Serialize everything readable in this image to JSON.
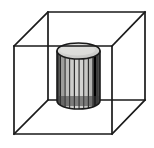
{
  "canvas": {
    "width": 154,
    "height": 148,
    "background": "#ffffff",
    "title": "Wireframe cube containing a fluted cylinder"
  },
  "colors": {
    "stroke": "#1a1a1a",
    "cylinder_outline": "#1a1a1a",
    "cylinder_top_fill": "#d8d8d6",
    "cylinder_body_light": "#c9c9c7",
    "cylinder_body_mid": "#9a9a98",
    "cylinder_body_dark": "#4a4a4a",
    "cylinder_edge_dark": "#2b2b2b",
    "background": "#ffffff"
  },
  "cube": {
    "label": "wireframe cube",
    "stroke_width": 1.7,
    "projection": "oblique",
    "front_face": {
      "label": "front face",
      "top_left": [
        14,
        46
      ],
      "top_right": [
        112,
        46
      ],
      "bottom_right": [
        112,
        134
      ],
      "bottom_left": [
        14,
        134
      ]
    },
    "back_face": {
      "label": "back face",
      "top_left": [
        48,
        12
      ],
      "top_right": [
        145,
        12
      ],
      "bottom_right": [
        145,
        100
      ],
      "bottom_left": [
        48,
        100
      ]
    },
    "connecting_edges": [
      {
        "name": "edge-top-left",
        "from": [
          14,
          46
        ],
        "to": [
          48,
          12
        ]
      },
      {
        "name": "edge-top-right",
        "from": [
          112,
          46
        ],
        "to": [
          145,
          12
        ]
      },
      {
        "name": "edge-bottom-right",
        "from": [
          112,
          134
        ],
        "to": [
          145,
          100
        ]
      },
      {
        "name": "edge-bottom-left",
        "from": [
          14,
          134
        ],
        "to": [
          48,
          100
        ]
      }
    ]
  },
  "cylinder": {
    "label": "fluted cylinder",
    "center_x": 78.5,
    "left_x": 57,
    "right_x": 100,
    "radius_x": 21.5,
    "top_y": 51,
    "bottom_y": 101,
    "ellipse_radius_y": 8,
    "stroke_width": 1.6,
    "flute_count": 10,
    "flutes": [
      {
        "index": 0,
        "x": 58.5,
        "width": 3.6,
        "shade": "#6a6a68"
      },
      {
        "index": 1,
        "x": 62.6,
        "width": 3.6,
        "shade": "#b0b0ae"
      },
      {
        "index": 2,
        "x": 66.7,
        "width": 3.6,
        "shade": "#c9c9c7"
      },
      {
        "index": 3,
        "x": 70.8,
        "width": 3.6,
        "shade": "#d2d2d0"
      },
      {
        "index": 4,
        "x": 74.9,
        "width": 3.6,
        "shade": "#d5d5d3"
      },
      {
        "index": 5,
        "x": 79.0,
        "width": 3.6,
        "shade": "#d2d2d0"
      },
      {
        "index": 6,
        "x": 83.1,
        "width": 3.6,
        "shade": "#cccccA"
      },
      {
        "index": 7,
        "x": 87.2,
        "width": 3.6,
        "shade": "#c0c0be"
      },
      {
        "index": 8,
        "x": 91.3,
        "width": 3.6,
        "shade": "#a8a8a6"
      },
      {
        "index": 9,
        "x": 95.4,
        "width": 3.6,
        "shade": "#7e7e7c"
      }
    ]
  },
  "caption": {
    "text": ""
  }
}
